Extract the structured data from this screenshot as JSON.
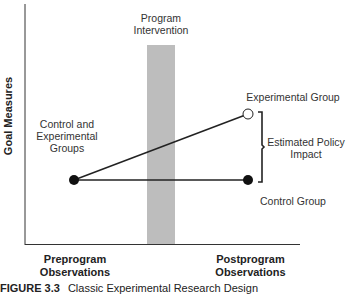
{
  "diagram": {
    "type": "classic experimental research design",
    "y_axis_label": "Goal Measures",
    "x_labels": {
      "pre": [
        "Preprogram",
        "Observations"
      ],
      "post": [
        "Postprogram",
        "Observations"
      ]
    },
    "intervention_label": [
      "Program",
      "Intervention"
    ],
    "group_labels": {
      "combined": [
        "Control and",
        "Experimental",
        "Groups"
      ],
      "experimental": "Experimental Group",
      "control": "Control Group",
      "impact": [
        "Estimated Policy",
        "Impact"
      ]
    },
    "caption": {
      "number": "FIGURE 3.3",
      "title": "Classic Experimental Research Design"
    },
    "colors": {
      "line": "#222222",
      "intervention_bar": "#bdbdbd",
      "point_filled": "#111111",
      "point_open": "#ffffff"
    }
  }
}
